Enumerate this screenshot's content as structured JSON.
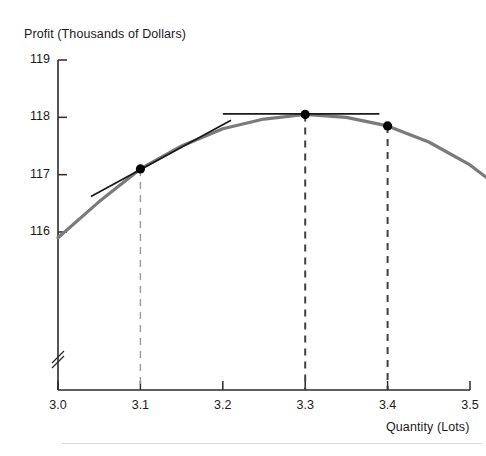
{
  "chart_data": {
    "type": "line",
    "title": "",
    "ylabel": "Profit (Thousands of Dollars)",
    "xlabel": "Quantity (Lots)",
    "xlim": [
      3.0,
      3.5
    ],
    "ylim": [
      115.9,
      119.0
    ],
    "x_ticks": [
      "3.0",
      "3.1",
      "3.2",
      "3.3",
      "3.4",
      "3.5"
    ],
    "x_tick_values": [
      3.0,
      3.1,
      3.2,
      3.3,
      3.4,
      3.5
    ],
    "y_ticks": [
      "116",
      "117",
      "118",
      "119"
    ],
    "y_tick_values": [
      116,
      117,
      118,
      119
    ],
    "grid": false,
    "legend": "none",
    "y_axis_break": true,
    "series": [
      {
        "name": "Profit curve",
        "type": "curve",
        "color": "#7a7a7a",
        "x": [
          3.0,
          3.05,
          3.1,
          3.15,
          3.2,
          3.25,
          3.3,
          3.35,
          3.4,
          3.45,
          3.5,
          3.52
        ],
        "y": [
          115.9,
          116.53,
          117.1,
          117.5,
          117.8,
          117.97,
          118.05,
          118.0,
          117.85,
          117.57,
          117.17,
          116.95
        ]
      }
    ],
    "points": [
      {
        "label": "point-3-1",
        "x": 3.1,
        "y": 117.1
      },
      {
        "label": "point-3-3",
        "x": 3.3,
        "y": 118.05
      },
      {
        "label": "point-3-4",
        "x": 3.4,
        "y": 117.85
      }
    ],
    "tangent_lines": [
      {
        "label": "tangent-at-3-1",
        "x_start": 3.04,
        "y_start": 116.62,
        "x_end": 3.21,
        "y_end": 117.95,
        "orientation": "sloped"
      },
      {
        "label": "tangent-at-peak",
        "x_start": 3.2,
        "y_start": 118.06,
        "x_end": 3.39,
        "y_end": 118.06,
        "orientation": "horizontal"
      }
    ],
    "droplines": [
      {
        "label": "dropline-3-1",
        "x": 3.1,
        "y_top": 117.1,
        "shade": "light"
      },
      {
        "label": "dropline-3-3",
        "x": 3.3,
        "y_top": 118.05,
        "shade": "dark"
      },
      {
        "label": "dropline-3-4",
        "x": 3.4,
        "y_top": 117.85,
        "shade": "dark"
      }
    ],
    "colors": {
      "curve": "#7a7a7a",
      "axis": "#2b2b2b",
      "point": "#000000",
      "tangent": "#1a1a1a",
      "dropline_light": "#9a9a9a",
      "dropline_dark": "#404040",
      "background": "#ffffff"
    }
  }
}
